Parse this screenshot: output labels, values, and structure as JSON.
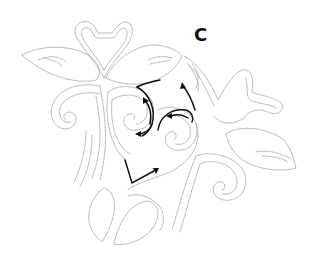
{
  "figure": {
    "panel_label": "C",
    "colors": {
      "stitch_line": "#a9a9a9",
      "arrow": "#111111",
      "background": "#ffffff"
    },
    "motifs": [
      "swan-pair-top",
      "leaf-left",
      "leaf-top-right",
      "spiral-left",
      "spiral-center",
      "spiral-center-right",
      "swan-right",
      "leaf-right",
      "spiral-bottom-right",
      "leaf-bottom-left",
      "leaf-bottom-center"
    ],
    "arrows": [
      "arc-arrow-up",
      "arc-arrow-left",
      "curve-arrow-up",
      "arc-arrow-left-2",
      "v-arrow-right"
    ]
  }
}
